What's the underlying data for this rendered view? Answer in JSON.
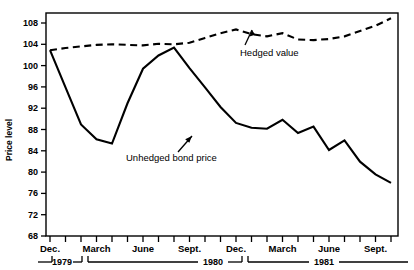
{
  "chart_data": {
    "type": "line",
    "title": "",
    "xlabel": "",
    "ylabel": "Price level",
    "ylim": [
      68,
      110
    ],
    "yticks": [
      68,
      72,
      76,
      80,
      84,
      88,
      92,
      96,
      100,
      104,
      108
    ],
    "grid": false,
    "legend_position": "inline-annotations",
    "x": [
      "Dec. 1979",
      "Jan. 1980",
      "Feb. 1980",
      "March 1980",
      "April 1980",
      "May 1980",
      "June 1980",
      "July 1980",
      "Aug. 1980",
      "Sept. 1980",
      "Oct. 1980",
      "Nov. 1980",
      "Dec. 1980",
      "Jan. 1981",
      "Feb. 1981",
      "March 1981",
      "April 1981",
      "May 1981",
      "June 1981",
      "July 1981",
      "Aug. 1981",
      "Sept. 1981",
      "Oct. 1981"
    ],
    "xtick_labels": [
      "Dec.",
      "March",
      "June",
      "Sept.",
      "Dec.",
      "March",
      "June",
      "Sept."
    ],
    "xtick_positions": [
      0,
      3,
      6,
      9,
      12,
      15,
      18,
      21
    ],
    "year_spans": [
      {
        "label": "1979",
        "start": 0,
        "end": 0
      },
      {
        "label": "1980",
        "start": 1,
        "end": 12
      },
      {
        "label": "1981",
        "start": 13,
        "end": 22
      }
    ],
    "series": [
      {
        "name": "Hedged value",
        "style": "dashed",
        "values": [
          103.0,
          103.4,
          103.7,
          104.0,
          104.1,
          104.0,
          103.9,
          104.2,
          104.1,
          104.4,
          105.3,
          106.2,
          106.9,
          106.0,
          105.6,
          106.2,
          105.0,
          104.9,
          105.1,
          105.6,
          106.6,
          107.6,
          109.0
        ]
      },
      {
        "name": "Unhedged bond price",
        "style": "solid",
        "values": [
          103.0,
          96.0,
          89.0,
          86.2,
          85.4,
          93.0,
          99.5,
          102.0,
          103.5,
          99.6,
          96.0,
          92.3,
          89.3,
          88.4,
          88.2,
          89.9,
          87.4,
          88.6,
          84.2,
          86.0,
          82.0,
          79.6,
          78.0
        ]
      }
    ],
    "annotations": [
      {
        "text": "Hedged value",
        "name": "hedged-value-annotation"
      },
      {
        "text": "Unhedged bond price",
        "name": "unhedged-bond-price-annotation"
      }
    ]
  },
  "colors": {
    "line": "#000000",
    "frame": "#000000",
    "background": "#ffffff"
  }
}
